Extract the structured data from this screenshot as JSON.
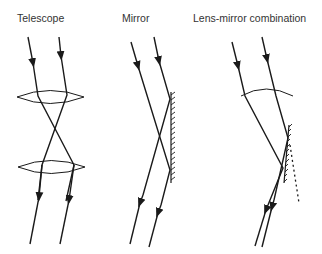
{
  "panels": [
    {
      "id": "telescope",
      "title": "Telescope"
    },
    {
      "id": "mirror",
      "title": "Mirror"
    },
    {
      "id": "lens-mirror",
      "title": "Lens-mirror combination"
    }
  ],
  "colors": {
    "stroke": "#1a1a1a",
    "text": "#333333",
    "background": "#ffffff"
  }
}
